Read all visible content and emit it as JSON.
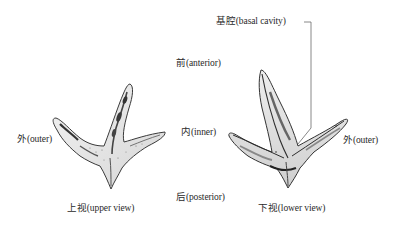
{
  "labels": {
    "basal_cavity": "基腔(basal cavity)",
    "anterior": "前(anterior)",
    "inner": "内(inner)",
    "posterior": "后(posterior)",
    "outer_left": "外(outer)",
    "outer_right": "外(outer)",
    "upper_view": "上视(upper view)",
    "lower_view": "下视(lower view)"
  },
  "figures": {
    "left": {
      "name": "upper-view-specimen"
    },
    "right": {
      "name": "lower-view-specimen"
    }
  },
  "colors": {
    "ink": "#2a2a2a",
    "leader_line": "#6a6a6a",
    "background": "#ffffff"
  }
}
